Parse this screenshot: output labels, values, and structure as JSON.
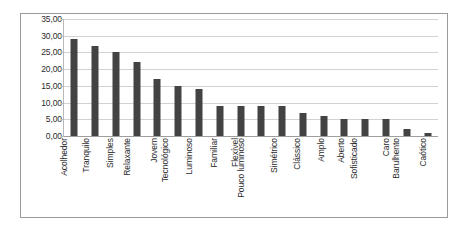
{
  "chart_data": {
    "type": "bar",
    "title": "",
    "xlabel": "",
    "ylabel": "",
    "ylim": [
      0,
      35
    ],
    "ytick_step": 5,
    "grid": true,
    "legend": false,
    "legend_position": "none",
    "decimal_separator": ",",
    "bar_color": "#434343",
    "gridline_color": "#d2d2d2",
    "border_color": "#9a9a9a",
    "ytick_labels": [
      "35,00",
      "30,00",
      "25,00",
      "20,00",
      "15,00",
      "10,00",
      "5,00",
      "0,00"
    ],
    "ytick_values": [
      35,
      30,
      25,
      20,
      15,
      10,
      5,
      0
    ],
    "categories": [
      "Acolhedor",
      "Tranquilo",
      "Simples",
      "Relaxante",
      "Jovem",
      "Tecnológico",
      "Luminoso",
      "Familiar",
      "Flexível",
      "Pouco luminoso",
      "Simétrico",
      "Clássico",
      "Amplo",
      "Aberto",
      "Sofisticado",
      "Caro",
      "Barulhento",
      "Caótico"
    ],
    "values": [
      29,
      27,
      25,
      22,
      17,
      15,
      14,
      9,
      9,
      9,
      9,
      7,
      6,
      5,
      5,
      5,
      2,
      1
    ]
  }
}
